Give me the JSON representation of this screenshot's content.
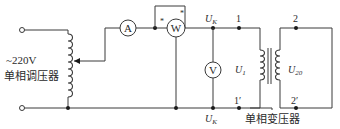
{
  "diagram": {
    "source_label": "~220V",
    "regulator_label": "单相调压器",
    "transformer_label": "单相变压器",
    "meters": {
      "ammeter": "A",
      "wattmeter": "W",
      "voltmeter": "V"
    },
    "polarity_mark": "*",
    "node_labels": {
      "uk_top": "U",
      "uk_top_sub": "K",
      "uk_bottom": "U",
      "uk_bottom_sub": "K",
      "primary_top": "1",
      "primary_bottom": "1′",
      "secondary_top": "2",
      "secondary_bottom": "2′"
    },
    "voltage_labels": {
      "u1": "U",
      "u1_sub": "1",
      "u20": "U",
      "u20_sub": "20"
    }
  }
}
